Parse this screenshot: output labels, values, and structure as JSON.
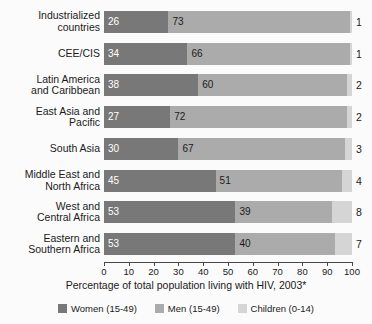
{
  "chart_data": {
    "type": "bar",
    "subtype": "stacked-horizontal-bar",
    "title": "",
    "xlabel": "Percentage of total population living with HIV, 2003*",
    "ylabel": "",
    "xlim": [
      0,
      100
    ],
    "xticks": [
      0,
      10,
      20,
      30,
      40,
      50,
      60,
      70,
      80,
      90,
      100
    ],
    "xtick_labels": [
      "0",
      "10",
      "20",
      "30",
      "40",
      "50",
      "60",
      "70",
      "80",
      "90",
      "100"
    ],
    "grid": false,
    "legend_position": "bottom",
    "categories": [
      "Industrialized countries",
      "CEE/CIS",
      "Latin America and Caribbean",
      "East Asia and Pacific",
      "South Asia",
      "Middle East and North Africa",
      "West and Central Africa",
      "Eastern and Southern Africa"
    ],
    "category_lines": [
      [
        "Industrialized",
        "countries"
      ],
      [
        "CEE/CIS"
      ],
      [
        "Latin America",
        "and Caribbean"
      ],
      [
        "East Asia and",
        "Pacific"
      ],
      [
        "South Asia"
      ],
      [
        "Middle East and",
        "North Africa"
      ],
      [
        "West and",
        "Central Africa"
      ],
      [
        "Eastern and",
        "Southern Africa"
      ]
    ],
    "series": [
      {
        "name": "Women (15-49)",
        "color": "#787878",
        "values": [
          26,
          34,
          38,
          27,
          30,
          45,
          53,
          53
        ]
      },
      {
        "name": "Men (15-49)",
        "color": "#ababab",
        "values": [
          73,
          66,
          60,
          72,
          67,
          51,
          39,
          40
        ]
      },
      {
        "name": "Children (0-14)",
        "color": "#d5d5d5",
        "values": [
          1,
          1,
          2,
          2,
          3,
          4,
          8,
          7
        ]
      }
    ]
  },
  "legend": {
    "items": [
      {
        "label": "Women (15-49)",
        "color": "#787878"
      },
      {
        "label": "Men (15-49)",
        "color": "#ababab"
      },
      {
        "label": "Children (0-14)",
        "color": "#d5d5d5"
      }
    ]
  }
}
